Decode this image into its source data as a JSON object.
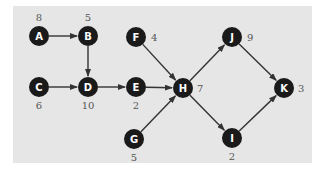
{
  "diagram": {
    "type": "directed-graph",
    "colors": {
      "panel": "#e6e6e6",
      "node": "#1a1a1a",
      "node_text": "#ffffff",
      "edge": "#333333",
      "weight_text": "#555555"
    },
    "nodes": [
      {
        "id": "A",
        "label": "A",
        "weight": "8",
        "x": 39,
        "y": 36,
        "wx": 39,
        "wy": 21,
        "anchor": "middle"
      },
      {
        "id": "B",
        "label": "B",
        "weight": "5",
        "x": 88,
        "y": 36,
        "wx": 88,
        "wy": 21,
        "anchor": "middle"
      },
      {
        "id": "C",
        "label": "C",
        "weight": "6",
        "x": 39,
        "y": 87,
        "wx": 39,
        "wy": 109,
        "anchor": "middle"
      },
      {
        "id": "D",
        "label": "D",
        "weight": "10",
        "x": 88,
        "y": 87,
        "wx": 88,
        "wy": 109,
        "anchor": "middle"
      },
      {
        "id": "E",
        "label": "E",
        "weight": "2",
        "x": 136,
        "y": 87,
        "wx": 136,
        "wy": 109,
        "anchor": "middle"
      },
      {
        "id": "F",
        "label": "F",
        "weight": "4",
        "x": 136,
        "y": 37,
        "wx": 151,
        "wy": 41,
        "anchor": "start"
      },
      {
        "id": "G",
        "label": "G",
        "weight": "5",
        "x": 134,
        "y": 139,
        "wx": 134,
        "wy": 161,
        "anchor": "middle"
      },
      {
        "id": "H",
        "label": "H",
        "weight": "7",
        "x": 183,
        "y": 88,
        "wx": 197,
        "wy": 92,
        "anchor": "start"
      },
      {
        "id": "I",
        "label": "I",
        "weight": "2",
        "x": 232,
        "y": 138,
        "wx": 232,
        "wy": 160,
        "anchor": "middle"
      },
      {
        "id": "J",
        "label": "J",
        "weight": "9",
        "x": 232,
        "y": 37,
        "wx": 247,
        "wy": 41,
        "anchor": "start"
      },
      {
        "id": "K",
        "label": "K",
        "weight": "3",
        "x": 284,
        "y": 88,
        "wx": 298,
        "wy": 92,
        "anchor": "start"
      }
    ],
    "edges": [
      {
        "from": "A",
        "to": "B"
      },
      {
        "from": "B",
        "to": "D"
      },
      {
        "from": "C",
        "to": "D"
      },
      {
        "from": "D",
        "to": "E"
      },
      {
        "from": "E",
        "to": "H"
      },
      {
        "from": "F",
        "to": "H"
      },
      {
        "from": "G",
        "to": "H"
      },
      {
        "from": "H",
        "to": "J"
      },
      {
        "from": "H",
        "to": "I"
      },
      {
        "from": "J",
        "to": "K"
      },
      {
        "from": "I",
        "to": "K"
      }
    ]
  }
}
